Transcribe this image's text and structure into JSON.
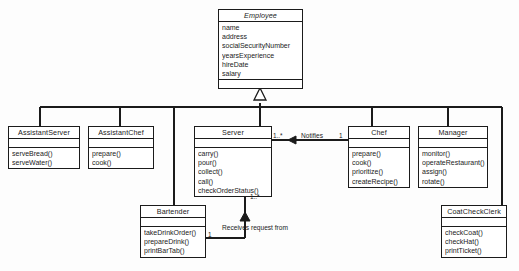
{
  "diagram": {
    "type": "uml-class-diagram",
    "line_color": "#1b1b1b",
    "background_color": "#fdfdfd"
  },
  "classes": [
    {
      "id": "employee",
      "name": "Employee",
      "abstract": true,
      "attributes": [
        "name",
        "address",
        "socialSecurityNumber",
        "yearsExperience",
        "hireDate",
        "salary"
      ],
      "operations": []
    },
    {
      "id": "assistant-server",
      "name": "AssistantServer",
      "abstract": false,
      "attributes": [],
      "operations": [
        "serveBread()",
        "serveWater()"
      ]
    },
    {
      "id": "assistant-chef",
      "name": "AssistantChef",
      "abstract": false,
      "attributes": [],
      "operations": [
        "prepare()",
        "cook()"
      ]
    },
    {
      "id": "server",
      "name": "Server",
      "abstract": false,
      "attributes": [],
      "operations": [
        "carry()",
        "pour()",
        "collect()",
        "call()",
        "checkOrderStatus()"
      ]
    },
    {
      "id": "chef",
      "name": "Chef",
      "abstract": false,
      "attributes": [],
      "operations": [
        "prepare()",
        "cook()",
        "prioritize()",
        "createRecipe()"
      ]
    },
    {
      "id": "manager",
      "name": "Manager",
      "abstract": false,
      "attributes": [],
      "operations": [
        "monitor()",
        "operateRestaurant()",
        "assign()",
        "rotate()"
      ]
    },
    {
      "id": "bartender",
      "name": "Bartender",
      "abstract": false,
      "attributes": [],
      "operations": [
        "takeDrinkOrder()",
        "prepareDrink()",
        "printBarTab()"
      ]
    },
    {
      "id": "coat-check-clerk",
      "name": "CoatCheckClerk",
      "abstract": false,
      "attributes": [],
      "operations": [
        "checkCoat()",
        "checkHat()",
        "printTicket()"
      ]
    }
  ],
  "associations": [
    {
      "id": "notifies",
      "label": "Notifies",
      "source": "chef",
      "target": "server",
      "source_multiplicity": "1",
      "target_multiplicity": "1..*"
    },
    {
      "id": "receives-request-from",
      "label": "Receives request from",
      "source": "bartender",
      "target": "server",
      "source_multiplicity": "1",
      "target_multiplicity": "1..*"
    }
  ],
  "generalizations": {
    "parent": "Employee",
    "children": [
      "AssistantServer",
      "AssistantChef",
      "Server",
      "Chef",
      "Manager",
      "Bartender",
      "CoatCheckClerk"
    ]
  }
}
